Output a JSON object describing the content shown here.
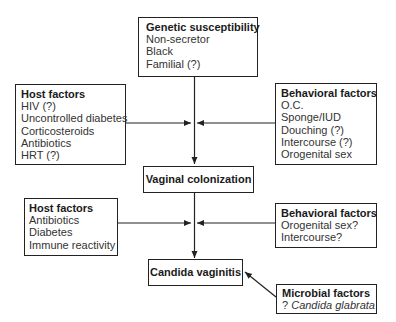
{
  "diagram": {
    "nodes": {
      "genetic": {
        "title": "Genetic susceptibility",
        "items": [
          "Non-secretor",
          "Black",
          "Familial (?)"
        ]
      },
      "host1": {
        "title": "Host factors",
        "items": [
          "HIV (?)",
          "Uncontrolled diabetes",
          "Corticosteroids",
          "Antibiotics",
          "HRT (?)"
        ]
      },
      "behavioral1": {
        "title": "Behavioral factors",
        "items": [
          "O.C.",
          "Sponge/IUD",
          "Douching (?)",
          "Intercourse (?)",
          "Orogenital sex"
        ]
      },
      "colonization": {
        "title": "Vaginal colonization"
      },
      "host2": {
        "title": "Host factors",
        "items": [
          "Antibiotics",
          "Diabetes",
          "Immune reactivity"
        ]
      },
      "behavioral2": {
        "title": "Behavioral factors",
        "items": [
          "Orogenital sex?",
          "Intercourse?"
        ]
      },
      "vaginitis": {
        "title": "Candida vaginitis"
      },
      "microbial": {
        "title": "Microbial factors",
        "prefix": "? ",
        "item_italic": "Candida glabrata"
      }
    },
    "edges": [
      {
        "from": "Genetic susceptibility",
        "to": "Vaginal colonization"
      },
      {
        "from": "Host factors (upper)",
        "to": "Genetic-to-colonization path"
      },
      {
        "from": "Behavioral factors (upper)",
        "to": "Genetic-to-colonization path"
      },
      {
        "from": "Vaginal colonization",
        "to": "Candida vaginitis"
      },
      {
        "from": "Host factors (lower)",
        "to": "Colonization-to-vaginitis path"
      },
      {
        "from": "Behavioral factors (lower)",
        "to": "Colonization-to-vaginitis path"
      },
      {
        "from": "Microbial factors",
        "to": "Candida vaginitis"
      }
    ],
    "colors": {
      "line": "#222222",
      "text": "#1a1a1a",
      "background": "#ffffff"
    }
  }
}
